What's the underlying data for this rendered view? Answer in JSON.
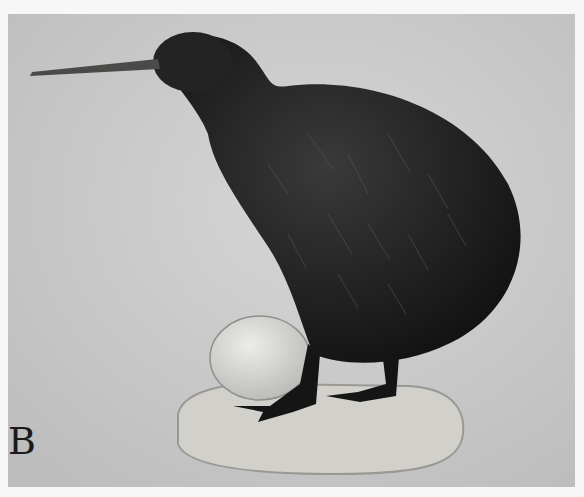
{
  "figure": {
    "panel_label": "B",
    "colors": {
      "background": "#c9c9c9",
      "bird": "#1c1c1c",
      "egg": "#dcdcd8",
      "base": "#d2d0cb",
      "margin": "#f7f7f7"
    }
  }
}
